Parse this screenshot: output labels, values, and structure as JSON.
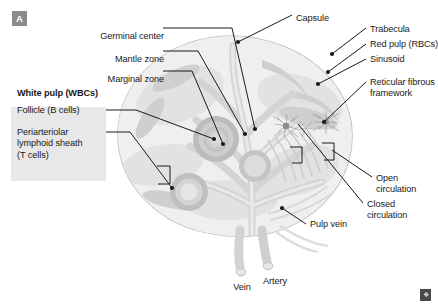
{
  "figure": {
    "panel_badge": "A",
    "signature_mark": "❖",
    "background_color": "#ffffff",
    "ink_color": "#1a1a1a",
    "badge_color": "#8c8c8c",
    "callout_box_color": "#e8e8e8",
    "organ_palette": {
      "capsule_outline": "#c9c9c9",
      "capsule_fill": "#f2f2f2",
      "parenchyma_fill": "#eaeaea",
      "red_pulp": "#dcdcdc",
      "trabecula": "#cfcfcf",
      "vessel": "#d6d6d6",
      "follicle_outer": "#b6b6b6",
      "follicle_mid": "#c9c9c9",
      "follicle_inner": "#dddddd"
    }
  },
  "labels": {
    "top_left": [
      {
        "id": "germinal-center",
        "text": "Germinal center",
        "x": 160,
        "y": 31,
        "align": "right"
      },
      {
        "id": "mantle-zone",
        "text": "Mantle zone",
        "x": 160,
        "y": 54,
        "align": "right"
      },
      {
        "id": "marginal-zone",
        "text": "Marginal zone",
        "x": 160,
        "y": 74,
        "align": "right"
      }
    ],
    "top_center": [
      {
        "id": "capsule",
        "text": "Capsule",
        "x": 296,
        "y": 18,
        "align": "left"
      }
    ],
    "right": [
      {
        "id": "trabecula",
        "text": "Trabecula",
        "x": 370,
        "y": 31,
        "align": "left"
      },
      {
        "id": "red-pulp",
        "text": "Red pulp (RBCs)",
        "x": 370,
        "y": 47,
        "align": "left"
      },
      {
        "id": "sinusoid",
        "text": "Sinusoid",
        "x": 370,
        "y": 62,
        "align": "left"
      },
      {
        "id": "reticular-fibrous-framework",
        "text": "Reticular fibrous\nframework",
        "x": 370,
        "y": 85,
        "align": "left"
      }
    ],
    "lower_right": [
      {
        "id": "open-circulation",
        "text": "Open\ncirculation",
        "x": 376,
        "y": 180,
        "align": "left"
      },
      {
        "id": "closed-circulation",
        "text": "Closed\ncirculation",
        "x": 367,
        "y": 206,
        "align": "left"
      }
    ],
    "bottom": [
      {
        "id": "pulp-vein",
        "text": "Pulp vein",
        "x": 310,
        "y": 227,
        "align": "left"
      },
      {
        "id": "vein",
        "text": "Vein",
        "x": 242,
        "y": 288,
        "align": "center"
      },
      {
        "id": "artery",
        "text": "Artery",
        "x": 275,
        "y": 283,
        "align": "center"
      }
    ],
    "white_pulp_group": {
      "heading": "White pulp (WBCs)",
      "heading_x": 17,
      "heading_y": 94,
      "items": [
        {
          "id": "follicle-b-cells",
          "text": "Follicle (B cells)",
          "x": 17,
          "y": 113
        },
        {
          "id": "periarteriolar-lymphoid-sheath",
          "text": "Periarteriolar\nlymphoid sheath\n(T cells)",
          "x": 17,
          "y": 135
        }
      ]
    }
  },
  "leader_lines": [
    {
      "from": "germinal-center",
      "path": "M 164,29 L 232,29 L 257,125"
    },
    {
      "from": "mantle-zone",
      "path": "M 164,52 L 196,52 L 248,133"
    },
    {
      "from": "marginal-zone",
      "path": "M 164,72 L 190,72 L 225,143"
    },
    {
      "from": "capsule",
      "path": "M 292,16 L 240,42"
    },
    {
      "from": "trabecula",
      "path": "M 366,29 L 335,52"
    },
    {
      "from": "red-pulp",
      "path": "M 366,45 L 330,70"
    },
    {
      "from": "sinusoid",
      "path": "M 366,60 L 320,82"
    },
    {
      "from": "reticular-fibrous-framework",
      "path": "M 366,83 L 320,122"
    },
    {
      "from": "open-circulation",
      "path": "M 372,178 L 330,150"
    },
    {
      "from": "closed-circulation",
      "path": "M 363,204 L 300,125"
    },
    {
      "from": "pulp-vein",
      "path": "M 306,225 L 284,209"
    },
    {
      "from": "follicle-b-cells",
      "path": "M 100,110 L 135,110 L 216,140"
    },
    {
      "from": "periarteriolar-lymphoid-sheath",
      "path": "M 100,133 L 128,133 L 170,186"
    }
  ]
}
